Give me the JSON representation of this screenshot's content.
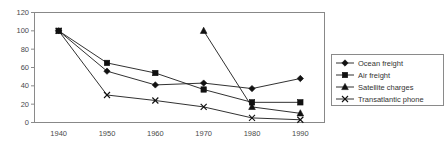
{
  "chart_data": {
    "type": "line",
    "title": "",
    "xlabel": "",
    "ylabel": "",
    "x": [
      1940,
      1950,
      1960,
      1970,
      1980,
      1990
    ],
    "categories": [
      "1940",
      "1950",
      "1960",
      "1970",
      "1980",
      "1990"
    ],
    "xlim": [
      1935,
      1995
    ],
    "ylim": [
      0,
      120
    ],
    "y_ticks": [
      0,
      20,
      40,
      60,
      80,
      100,
      120
    ],
    "grid": false,
    "legend_position": "right",
    "series": [
      {
        "name": "Ocean freight",
        "marker": "diamond",
        "x": [
          1940,
          1950,
          1960,
          1970,
          1980,
          1990
        ],
        "values": [
          100,
          56,
          41,
          43,
          37,
          48
        ]
      },
      {
        "name": "Air freight",
        "marker": "square",
        "x": [
          1940,
          1950,
          1960,
          1970,
          1980,
          1990
        ],
        "values": [
          100,
          65,
          54,
          36,
          22,
          22
        ]
      },
      {
        "name": "Satellite charges",
        "marker": "triangle",
        "x": [
          1970,
          1980,
          1990
        ],
        "values": [
          100,
          17,
          10
        ]
      },
      {
        "name": "Transatlantic phone",
        "marker": "cross",
        "x": [
          1940,
          1950,
          1960,
          1970,
          1980,
          1990
        ],
        "values": [
          100,
          30,
          24,
          17,
          5,
          3
        ]
      }
    ]
  },
  "axis": {
    "y_tick_labels": [
      "120",
      "100",
      "80",
      "60",
      "40",
      "20",
      "0"
    ],
    "x_tick_labels": [
      "1940",
      "1950",
      "1960",
      "1970",
      "1980",
      "1990"
    ]
  },
  "legend": {
    "entries": [
      {
        "label": "Ocean freight",
        "marker": "diamond"
      },
      {
        "label": "Air freight",
        "marker": "square"
      },
      {
        "label": "Satellite charges",
        "marker": "triangle"
      },
      {
        "label": "Transatlantic phone",
        "marker": "cross"
      }
    ]
  },
  "colors": {
    "series": "#111111",
    "frame": "#888888",
    "text": "#4a4a4a"
  }
}
